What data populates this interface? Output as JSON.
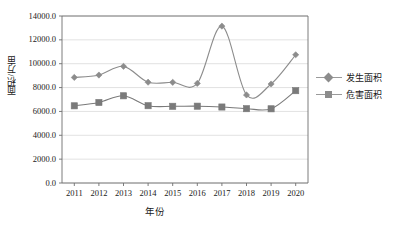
{
  "chart_data": {
    "type": "line",
    "title": "",
    "xlabel": "年份",
    "ylabel": "面积/万亩",
    "categories": [
      "2011",
      "2012",
      "2013",
      "2014",
      "2015",
      "2016",
      "2017",
      "2018",
      "2019",
      "2020"
    ],
    "series": [
      {
        "name": "发生面积",
        "marker": "diamond",
        "color": "#8c8c8c",
        "values": [
          8850,
          9050,
          9780,
          8450,
          8440,
          8350,
          13150,
          7380,
          8300,
          10750
        ]
      },
      {
        "name": "危害面积",
        "marker": "square",
        "color": "#7a7a7a",
        "values": [
          6470,
          6750,
          7310,
          6480,
          6430,
          6440,
          6370,
          6230,
          6220,
          7740
        ]
      }
    ],
    "ylim": [
      0,
      14000
    ],
    "ytick_values": [
      0,
      2000,
      4000,
      6000,
      8000,
      10000,
      12000,
      14000
    ],
    "ytick_labels": [
      "0.0",
      "2000.0",
      "4000.0",
      "6000.0",
      "8000.0",
      "10000.0",
      "12000.0",
      "14000.0"
    ],
    "grid": "horizontal",
    "legend_position": "right",
    "smooth": true
  },
  "legend": {
    "items": [
      {
        "label": "发生面积"
      },
      {
        "label": "危害面积"
      }
    ]
  },
  "axes": {
    "x_title": "年份",
    "y_title": "面积/万亩"
  }
}
